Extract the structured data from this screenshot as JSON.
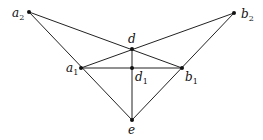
{
  "diagram": {
    "type": "graph",
    "nodes": [
      {
        "id": "a2",
        "base": "a",
        "sub": "2",
        "x": 29,
        "y": 12,
        "lx": 12,
        "ly": 17
      },
      {
        "id": "b2",
        "base": "b",
        "sub": "2",
        "x": 234,
        "y": 13,
        "lx": 241,
        "ly": 18
      },
      {
        "id": "d",
        "base": "d",
        "sub": "",
        "x": 132,
        "y": 49,
        "lx": 128,
        "ly": 43
      },
      {
        "id": "a1",
        "base": "a",
        "sub": "1",
        "x": 81,
        "y": 68,
        "lx": 66,
        "ly": 72
      },
      {
        "id": "d1",
        "base": "d",
        "sub": "1",
        "x": 132,
        "y": 68,
        "lx": 135,
        "ly": 81
      },
      {
        "id": "b1",
        "base": "b",
        "sub": "1",
        "x": 182,
        "y": 68,
        "lx": 185,
        "ly": 81
      },
      {
        "id": "e",
        "base": "e",
        "sub": "",
        "x": 132,
        "y": 120,
        "lx": 128,
        "ly": 134
      }
    ],
    "edges": [
      [
        "a2",
        "b1"
      ],
      [
        "a2",
        "e"
      ],
      [
        "b2",
        "a1"
      ],
      [
        "b2",
        "e"
      ],
      [
        "a1",
        "b1"
      ],
      [
        "d",
        "e"
      ]
    ]
  }
}
